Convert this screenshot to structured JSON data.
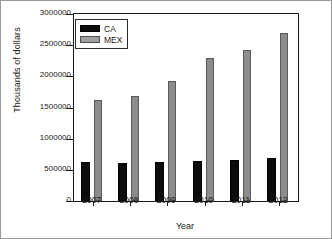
{
  "chart_data": {
    "type": "bar",
    "title": "",
    "xlabel": "Year",
    "ylabel": "Thousands of dollars",
    "categories": [
      "2007",
      "2008",
      "2009",
      "2010",
      "2011",
      "2012"
    ],
    "series": [
      {
        "name": "CA",
        "color": "#0b0b0b",
        "values": [
          625000,
          610000,
          630000,
          640000,
          665000,
          690000
        ]
      },
      {
        "name": "MEX",
        "color": "#8c8c8c",
        "values": [
          1620000,
          1680000,
          1925000,
          2295000,
          2420000,
          2695000
        ]
      }
    ],
    "ylim": [
      0,
      3000000
    ],
    "yticks": [
      0,
      500000,
      1000000,
      1500000,
      2000000,
      2500000,
      3000000
    ],
    "ytick_labels": [
      "0",
      "500000",
      "1000000",
      "1500000",
      "2000000",
      "2500000",
      "3000000"
    ],
    "grid": false,
    "legend_position": "upper-left"
  }
}
